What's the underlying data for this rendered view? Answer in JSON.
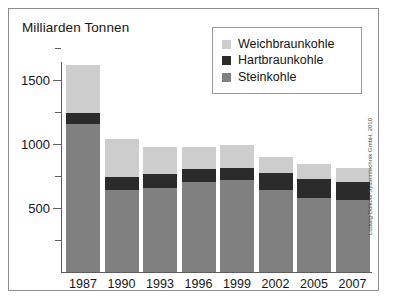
{
  "figure": {
    "title": "Milliarden Tonnen",
    "credit": "Ludwig-Bölkow-Systemtechnik GmbH, 2010"
  },
  "legend": {
    "position": "top-right",
    "items": [
      {
        "label": "Weichbraunkohle",
        "color": "#cdcdcd"
      },
      {
        "label": "Hartbraunkohle",
        "color": "#2b2b2b"
      },
      {
        "label": "Steinkohle",
        "color": "#808080"
      }
    ]
  },
  "axis": {
    "y_ticks_major": [
      "500",
      "1000",
      "1500"
    ],
    "x_labels": [
      "1987",
      "1990",
      "1993",
      "1996",
      "1999",
      "2002",
      "2005",
      "2007"
    ]
  },
  "chart_data": {
    "type": "bar",
    "stacked": true,
    "title": "Milliarden Tonnen",
    "xlabel": "",
    "ylabel": "Milliarden Tonnen",
    "ylim": [
      0,
      1750
    ],
    "ytick_values": [
      500,
      1000,
      1500
    ],
    "ytick_minor_values": [
      250,
      750,
      1250,
      1500,
      1750
    ],
    "grid": false,
    "legend_position": "top-right",
    "categories": [
      "1987",
      "1990",
      "1993",
      "1996",
      "1999",
      "2002",
      "2005",
      "2007"
    ],
    "series": [
      {
        "name": "Steinkohle",
        "color": "#808080",
        "values": [
          1160,
          640,
          660,
          700,
          715,
          640,
          580,
          560
        ]
      },
      {
        "name": "Hartbraunkohle",
        "color": "#2b2b2b",
        "values": [
          80,
          100,
          105,
          105,
          100,
          130,
          145,
          145
        ]
      },
      {
        "name": "Weichbraunkohle",
        "color": "#cdcdcd",
        "values": [
          380,
          300,
          215,
          175,
          175,
          130,
          115,
          105
        ]
      }
    ],
    "totals": [
      1620,
      1040,
      980,
      980,
      990,
      900,
      840,
      810
    ],
    "units": "Milliarden Tonnen",
    "annotations": [
      "Ludwig-Bölkow-Systemtechnik GmbH, 2010"
    ]
  },
  "render": {
    "baseline_y": 272,
    "px_per_unit": 0.128,
    "plot_left": 66,
    "bar_width": 34,
    "bar_pitch": 38.5
  }
}
